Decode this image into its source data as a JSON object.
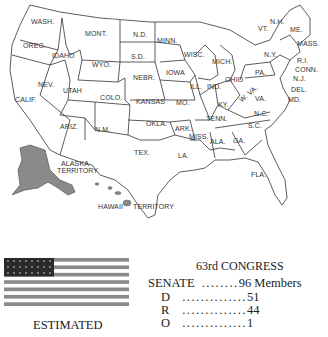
{
  "map": {
    "states": [
      "WASH.",
      "OREG.",
      "CALIF.",
      "IDAHO",
      "NEV.",
      "MONT.",
      "WYO.",
      "UTAH",
      "COLO.",
      "ARIZ.",
      "N.M.",
      "N.D.",
      "S.D.",
      "NEBR.",
      "KANSAS",
      "OKLA.",
      "TEX.",
      "MINN.",
      "IOWA",
      "MO.",
      "ARK.",
      "LA.",
      "WISC.",
      "ILL.",
      "MICH.",
      "IND.",
      "OHIO",
      "KY.",
      "TENN.",
      "MISS.",
      "ALA.",
      "GA.",
      "FLA.",
      "S.C.",
      "N.C.",
      "VA.",
      "W. VA.",
      "PA.",
      "N.Y.",
      "VT.",
      "N.H.",
      "ME.",
      "MASS.",
      "R.I.",
      "CONN.",
      "N.J.",
      "DEL.",
      "MD."
    ],
    "territories": [
      "ALASKA TERRITORY",
      "HAWAII",
      "TERRITORY"
    ]
  },
  "congress": {
    "title": "63rd CONGRESS",
    "senate": {
      "label": "SENATE",
      "dots": "........",
      "value": "96 Members"
    },
    "senate_rows": [
      {
        "party": "D",
        "dots": "..............",
        "value": "51"
      },
      {
        "party": "R",
        "dots": "..............",
        "value": "44"
      },
      {
        "party": "O",
        "dots": "..............",
        "value": "1"
      }
    ],
    "house": {
      "label": "HOUSE",
      "dots": "........",
      "value": "435 Members"
    },
    "house_rows": [
      {
        "party": "D",
        "dots": "...........",
        "value": "291"
      }
    ]
  },
  "flag": {
    "stars": 48,
    "stripes": 13,
    "stripe_color": "#8a8a8a",
    "canton_color": "#2a2a2a"
  },
  "caption": "ESTIMATED"
}
